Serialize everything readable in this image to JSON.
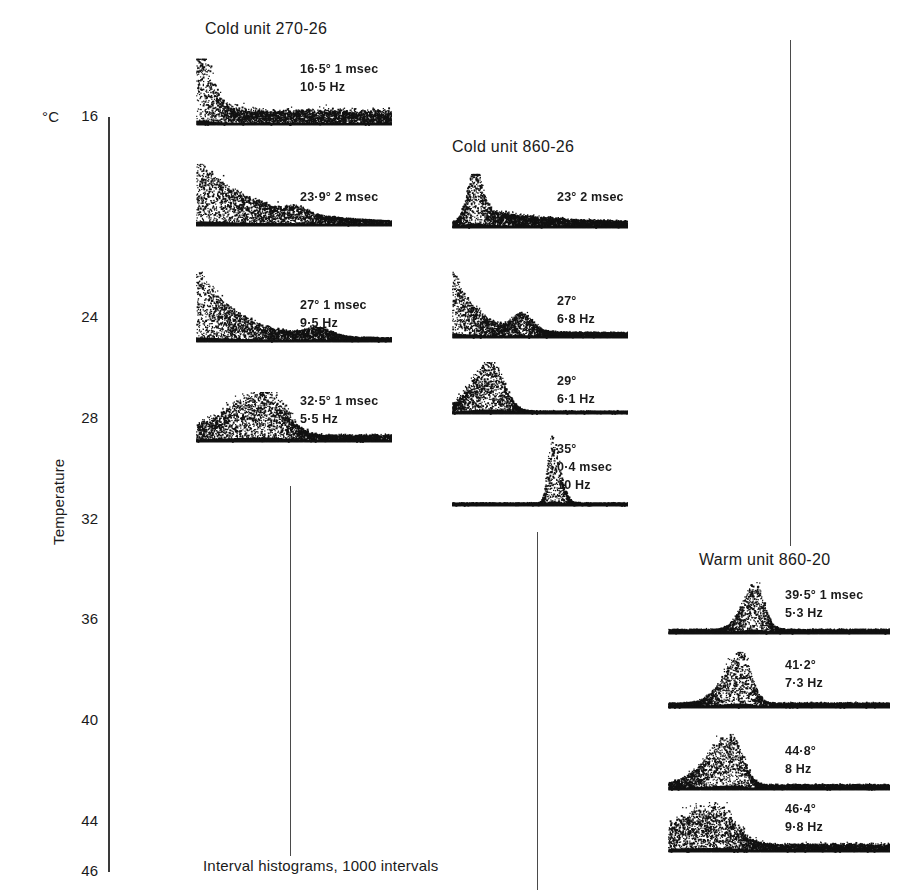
{
  "figure": {
    "width": 901,
    "height": 892,
    "background": "#ffffff",
    "ink_color": "#111111",
    "caption": "Interval histograms, 1000 intervals"
  },
  "axis": {
    "unit_label": "°C",
    "title": "Temperature",
    "min": 16,
    "max": 46,
    "tick_labels": [
      "16",
      "24",
      "28",
      "32",
      "36",
      "40",
      "44",
      "46"
    ],
    "tick_values": [
      16,
      24,
      28,
      32,
      36,
      40,
      44,
      46
    ]
  },
  "columns": [
    {
      "id": "cold-unit-270-26",
      "title": "Cold unit 270-26",
      "title_x": 205,
      "title_y": 20,
      "panels": [
        {
          "id": "panel-16-5",
          "temperature": 16.5,
          "labels": [
            "16·5° 1 msec",
            "10·5 Hz"
          ],
          "label_x": 300,
          "label_y": 60,
          "x": 196,
          "y": 55,
          "width": 196,
          "height": 72,
          "shape": "decay",
          "params": {
            "decay": 0.055,
            "amp": 0.92,
            "noise": 0.3,
            "baseline": 0.2,
            "density": 2400,
            "start": 0.04,
            "spread": 3.2
          }
        },
        {
          "id": "panel-23-9",
          "temperature": 23.9,
          "labels": [
            "23·9° 2 msec"
          ],
          "label_x": 300,
          "label_y": 188,
          "x": 196,
          "y": 160,
          "width": 196,
          "height": 68,
          "shape": "decay-bump",
          "params": {
            "decay": 0.3,
            "amp": 1.0,
            "noise": 0.05,
            "baseline": 0.045,
            "density": 2000,
            "start": 0.02,
            "spread": 1.0,
            "bump_pos": 0.52,
            "bump_amp": 0.1,
            "bump_width": 0.07
          }
        },
        {
          "id": "panel-27",
          "temperature": 27,
          "labels": [
            "27° 1 msec",
            "9·5 Hz"
          ],
          "label_x": 300,
          "label_y": 296,
          "x": 196,
          "y": 268,
          "width": 196,
          "height": 76,
          "shape": "decay-bump",
          "params": {
            "decay": 0.2,
            "amp": 1.0,
            "noise": 0.07,
            "baseline": 0.05,
            "density": 2200,
            "start": 0.02,
            "spread": 1.4,
            "bump_pos": 0.62,
            "bump_amp": 0.12,
            "bump_width": 0.09
          }
        },
        {
          "id": "panel-32-5",
          "temperature": 32.5,
          "labels": [
            "32·5° 1 msec",
            "5·5 Hz"
          ],
          "label_x": 300,
          "label_y": 392,
          "x": 196,
          "y": 388,
          "width": 196,
          "height": 56,
          "shape": "hump",
          "params": {
            "peak": 0.36,
            "width": 0.13,
            "amp": 0.88,
            "noise": 0.22,
            "baseline": 0.13,
            "density": 2400,
            "left_tail": 0.3
          }
        }
      ]
    },
    {
      "id": "cold-unit-860-26",
      "title": "Cold unit 860-26",
      "title_x": 452,
      "title_y": 138,
      "panels": [
        {
          "id": "panel-23",
          "temperature": 23,
          "labels": [
            "23° 2 msec"
          ],
          "label_x": 557,
          "label_y": 188,
          "x": 452,
          "y": 170,
          "width": 176,
          "height": 60,
          "shape": "peak-decay",
          "params": {
            "peak": 0.12,
            "width": 0.055,
            "amp": 1.0,
            "noise": 0.16,
            "baseline": 0.1,
            "density": 2600,
            "tail": 0.34,
            "tail_amp": 0.3
          }
        },
        {
          "id": "panel-27b",
          "temperature": 27,
          "labels": [
            "27°",
            "6·8 Hz"
          ],
          "label_x": 557,
          "label_y": 292,
          "x": 452,
          "y": 268,
          "width": 176,
          "height": 72,
          "shape": "decay-bump",
          "params": {
            "decay": 0.13,
            "amp": 0.95,
            "noise": 0.13,
            "baseline": 0.08,
            "density": 2400,
            "start": 0.01,
            "spread": 1.8,
            "bump_pos": 0.4,
            "bump_amp": 0.26,
            "bump_width": 0.075
          }
        },
        {
          "id": "panel-29",
          "temperature": 29,
          "labels": [
            "29°",
            "6·1 Hz"
          ],
          "label_x": 557,
          "label_y": 372,
          "x": 452,
          "y": 358,
          "width": 176,
          "height": 58,
          "shape": "hump",
          "params": {
            "peak": 0.22,
            "width": 0.1,
            "amp": 0.95,
            "noise": 0.18,
            "baseline": 0.05,
            "density": 2400,
            "left_tail": 0.16
          }
        },
        {
          "id": "panel-35",
          "temperature": 35,
          "labels": [
            "35°",
            "0·4 msec",
            "10 Hz"
          ],
          "label_x": 557,
          "label_y": 440,
          "x": 452,
          "y": 432,
          "width": 176,
          "height": 76,
          "shape": "hump",
          "params": {
            "peak": 0.56,
            "width": 0.065,
            "amp": 0.95,
            "noise": 0.14,
            "baseline": 0.04,
            "density": 2200,
            "left_tail": 0.03
          }
        }
      ]
    },
    {
      "id": "warm-unit-860-20",
      "title": "Warm unit 860-20",
      "title_x": 699,
      "title_y": 551,
      "panels": [
        {
          "id": "panel-39-5",
          "temperature": 39.5,
          "labels": [
            "39·5° 1 msec",
            "5·3 Hz"
          ],
          "label_x": 785,
          "label_y": 586,
          "x": 668,
          "y": 578,
          "width": 222,
          "height": 58,
          "shape": "hump",
          "params": {
            "peak": 0.39,
            "width": 0.055,
            "amp": 0.92,
            "noise": 0.13,
            "baseline": 0.085,
            "density": 2400,
            "left_tail": 0.08
          }
        },
        {
          "id": "panel-41-2",
          "temperature": 41.2,
          "labels": [
            "41·2°",
            "7·3 Hz"
          ],
          "label_x": 785,
          "label_y": 656,
          "x": 668,
          "y": 648,
          "width": 222,
          "height": 62,
          "shape": "hump",
          "params": {
            "peak": 0.33,
            "width": 0.06,
            "amp": 0.93,
            "noise": 0.16,
            "baseline": 0.085,
            "density": 2400,
            "left_tail": 0.11
          }
        },
        {
          "id": "panel-44-8",
          "temperature": 44.8,
          "labels": [
            "44·8°",
            "8 Hz"
          ],
          "label_x": 785,
          "label_y": 742,
          "x": 668,
          "y": 730,
          "width": 222,
          "height": 62,
          "shape": "hump",
          "params": {
            "peak": 0.29,
            "width": 0.065,
            "amp": 0.9,
            "noise": 0.16,
            "baseline": 0.09,
            "density": 2500,
            "left_tail": 0.16
          }
        },
        {
          "id": "panel-46-4",
          "temperature": 46.4,
          "labels": [
            "46·4°",
            "9·8 Hz"
          ],
          "label_x": 785,
          "label_y": 800,
          "x": 668,
          "y": 798,
          "width": 222,
          "height": 56,
          "shape": "hump",
          "params": {
            "peak": 0.21,
            "width": 0.12,
            "amp": 0.72,
            "noise": 0.3,
            "baseline": 0.14,
            "density": 2800,
            "left_tail": 0.26
          }
        }
      ]
    }
  ],
  "separators": [
    {
      "id": "separator-1",
      "x": 290,
      "y": 486,
      "height": 370
    },
    {
      "id": "separator-2",
      "x": 537,
      "y": 532,
      "height": 358
    },
    {
      "id": "separator-3",
      "x": 790,
      "y": 40,
      "height": 506
    }
  ],
  "axis_geometry": {
    "x": 108,
    "top_y": 117,
    "bottom_y": 872,
    "label_right_x": 98,
    "unit_x": 42,
    "unit_y": 108,
    "title_x": 50,
    "title_y": 545
  },
  "caption_position": {
    "x": 203,
    "y": 857
  },
  "chart_data": {
    "type": "scatter",
    "title": "Interval histograms, 1000 intervals",
    "ylabel": "Temperature",
    "yunit": "°C",
    "ylim": [
      16,
      46
    ],
    "yticks": [
      16,
      24,
      28,
      32,
      36,
      40,
      44,
      46
    ],
    "series": [
      {
        "name": "Cold unit 270-26",
        "records": [
          {
            "temperature": 16.5,
            "bin_width_msec": 1,
            "rate_hz": 10.5,
            "pattern": "monotonic decay"
          },
          {
            "temperature": 23.9,
            "bin_width_msec": 2,
            "rate_hz": null,
            "pattern": "sharp decay with small secondary bump"
          },
          {
            "temperature": 27,
            "bin_width_msec": 1,
            "rate_hz": 9.5,
            "pattern": "sharp decay with secondary bump"
          },
          {
            "temperature": 32.5,
            "bin_width_msec": 1,
            "rate_hz": 5.5,
            "pattern": "broad single mode"
          }
        ]
      },
      {
        "name": "Cold unit 860-26",
        "records": [
          {
            "temperature": 23,
            "bin_width_msec": 2,
            "rate_hz": null,
            "pattern": "early peak with long tail"
          },
          {
            "temperature": 27,
            "bin_width_msec": null,
            "rate_hz": 6.8,
            "pattern": "bimodal"
          },
          {
            "temperature": 29,
            "bin_width_msec": null,
            "rate_hz": 6.1,
            "pattern": "single mode"
          },
          {
            "temperature": 35,
            "bin_width_msec": 0.4,
            "rate_hz": 10,
            "pattern": "narrow single mode, late"
          }
        ]
      },
      {
        "name": "Warm unit 860-20",
        "records": [
          {
            "temperature": 39.5,
            "bin_width_msec": 1,
            "rate_hz": 5.3,
            "pattern": "narrow single mode"
          },
          {
            "temperature": 41.2,
            "bin_width_msec": null,
            "rate_hz": 7.3,
            "pattern": "narrow single mode"
          },
          {
            "temperature": 44.8,
            "bin_width_msec": null,
            "rate_hz": 8,
            "pattern": "single mode"
          },
          {
            "temperature": 46.4,
            "bin_width_msec": null,
            "rate_hz": 9.8,
            "pattern": "broad irregular mode"
          }
        ]
      }
    ]
  }
}
